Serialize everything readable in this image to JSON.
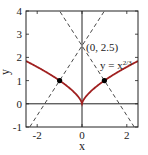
{
  "chart_data": {
    "type": "line",
    "title": "",
    "xlabel": "x",
    "ylabel": "y",
    "xlim": [
      -2.5,
      2.5
    ],
    "ylim": [
      -1,
      4
    ],
    "x_ticks": [
      -2,
      0,
      2
    ],
    "x_tick_labels": [
      "-2",
      "0",
      "2"
    ],
    "y_ticks": [
      -1,
      0,
      1,
      2,
      3,
      4
    ],
    "y_tick_labels": [
      "-1",
      "0",
      "1",
      "2",
      "3",
      "4"
    ],
    "grid": false,
    "series": [
      {
        "name": "y = x^(2/3)",
        "style": "solid",
        "color": "#a02020",
        "function": "y = |x|^(2/3)",
        "x_range": [
          -2.5,
          2.5
        ]
      },
      {
        "name": "normal line at (1,1)",
        "style": "dashed",
        "color": "#333333",
        "function": "y = -1.5x + 2.5"
      },
      {
        "name": "normal line at (-1,1)",
        "style": "dashed",
        "color": "#333333",
        "function": "y = 1.5x + 2.5"
      }
    ],
    "points": [
      {
        "x": -1,
        "y": 1,
        "marker": "filled-circle"
      },
      {
        "x": 1,
        "y": 1,
        "marker": "filled-circle"
      }
    ],
    "annotations": [
      {
        "text": "(0, 2.5)",
        "x": 0,
        "y": 2.5
      },
      {
        "text_base": "y = x",
        "text_sup": "2/3",
        "x": 1.1,
        "y": 1.85
      }
    ],
    "reference_lines": [
      {
        "axis": "x",
        "value": 0
      },
      {
        "axis": "y",
        "value": 0
      }
    ]
  }
}
